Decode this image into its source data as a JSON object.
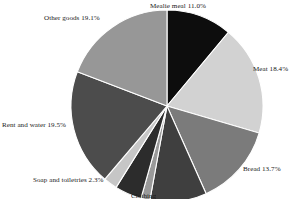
{
  "chart_data": {
    "type": "pie",
    "title": "",
    "subtitle": "",
    "xlabel": "",
    "ylabel": "",
    "legend_position": "none",
    "grid": false,
    "labels_outside": true,
    "value_suffix": "%",
    "categories": [
      "Mealie meal",
      "Meat",
      "Bread",
      "Unlabelled slice A",
      "Unlabelled slice B",
      "Unlabelled slice C",
      "Soap and toiletries",
      "Rent and water",
      "Other goods"
    ],
    "values": [
      11.0,
      18.4,
      13.7,
      9.5,
      1.5,
      4.5,
      2.3,
      19.5,
      19.1
    ],
    "slices": [
      {
        "name": "Mealie meal",
        "label": "Mealie meal 11.0%",
        "value": 11.0,
        "color": "#0d0d0d",
        "label_visible": true
      },
      {
        "name": "Meat",
        "label": "Meat 18.4%",
        "value": 18.4,
        "color": "#d2d2d2",
        "label_visible": true
      },
      {
        "name": "Bread",
        "label": "Bread 13.7%",
        "value": 13.7,
        "color": "#7b7b7b",
        "label_visible": true
      },
      {
        "name": "Unlabelled slice A",
        "label": "",
        "value": 9.5,
        "color": "#3f3f3f",
        "label_visible": false
      },
      {
        "name": "Unlabelled slice B",
        "label": "",
        "value": 1.5,
        "color": "#9a9a9a",
        "label_visible": false
      },
      {
        "name": "Unlabelled slice C",
        "label": "",
        "value": 4.5,
        "color": "#2c2c2c",
        "label_visible": false
      },
      {
        "name": "Soap and toiletries",
        "label": "Soap and toiletries 2.3%",
        "value": 2.3,
        "color": "#c6c6c6",
        "label_visible": true
      },
      {
        "name": "Rent and water",
        "label": "Rent and water 19.5%",
        "value": 19.5,
        "color": "#4c4c4c",
        "label_visible": true
      },
      {
        "name": "Other goods",
        "label": "Other goods 19.1%",
        "value": 19.1,
        "color": "#979797",
        "label_visible": true
      }
    ]
  },
  "labels": {
    "mealie_meal": "Mealie meal 11.0%",
    "meat": "Meat 18.4%",
    "bread": "Bread 13.7%",
    "rent_and_water": "Rent and water 19.5%",
    "soap_and_toiletries": "Soap and toiletries 2.3%",
    "other_goods": "Other goods 19.1%",
    "clipped_bottom": "Clothing"
  },
  "colors": {
    "background": "#ffffff",
    "text": "#1a1a1a",
    "slice_border": "#ffffff"
  }
}
